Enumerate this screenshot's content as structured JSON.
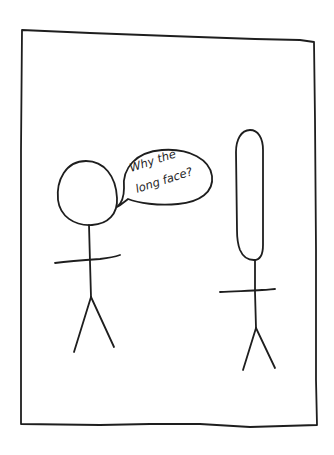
{
  "comic": {
    "panel_count": 1,
    "speech_bubble": {
      "speaker": "left-figure",
      "line1": "Why the",
      "line2": "long face?"
    },
    "figures": [
      {
        "id": "left-figure",
        "head_shape": "round"
      },
      {
        "id": "right-figure",
        "head_shape": "long-oval"
      }
    ],
    "colors": {
      "ink": "#1e1e1e",
      "paper": "#ffffff"
    }
  }
}
